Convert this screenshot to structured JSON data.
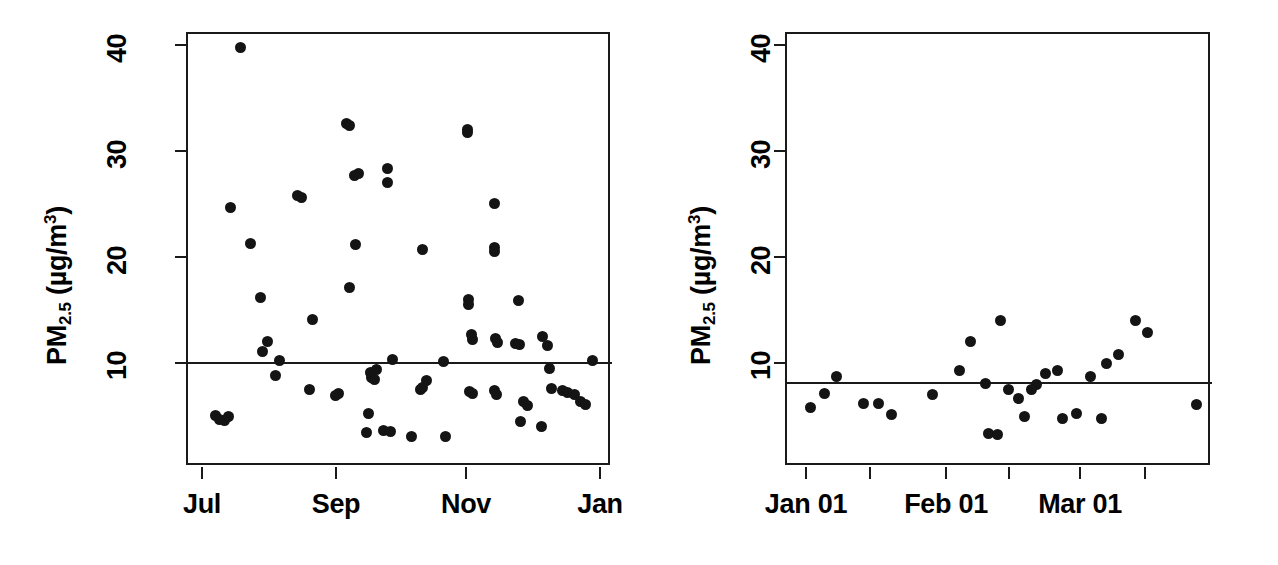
{
  "figure": {
    "background": "#ffffff",
    "point_color": "#141414",
    "axis_color": "#1a1a1a"
  },
  "chart_data": [
    {
      "type": "scatter",
      "panel": "left",
      "title": "",
      "xlabel": "",
      "ylabel": "PM2.5 (µg/m³)",
      "ylabel_parts": {
        "base": "PM",
        "sub": "2.5",
        "unit_open": " (µg/m",
        "sup": "3",
        "unit_close": ")"
      },
      "ylim": [
        1.5,
        42.5
      ],
      "yticks": [
        10,
        20,
        30,
        40
      ],
      "ytick_labels": [
        "10",
        "20",
        "30",
        "40"
      ],
      "xtick_labels": [
        "Jul",
        "Sep",
        "Nov",
        "Jan"
      ],
      "xtick_positions_px": [
        202,
        336,
        466,
        600
      ],
      "grid": false,
      "legend": "none",
      "reference_line": {
        "value": 10.3,
        "label": ""
      },
      "n_points": 68,
      "points": [
        {
          "x_px": 238,
          "y": 40.0
        },
        {
          "x_px": 228,
          "y": 24.9
        },
        {
          "x_px": 248,
          "y": 21.5
        },
        {
          "x_px": 258,
          "y": 16.4
        },
        {
          "x_px": 260,
          "y": 11.3
        },
        {
          "x_px": 265,
          "y": 12.2
        },
        {
          "x_px": 277,
          "y": 10.4
        },
        {
          "x_px": 273,
          "y": 9.0
        },
        {
          "x_px": 213,
          "y": 5.2
        },
        {
          "x_px": 217,
          "y": 4.9
        },
        {
          "x_px": 222,
          "y": 4.8
        },
        {
          "x_px": 226,
          "y": 5.1
        },
        {
          "x_px": 295,
          "y": 26.0
        },
        {
          "x_px": 299,
          "y": 25.8
        },
        {
          "x_px": 310,
          "y": 14.3
        },
        {
          "x_px": 307,
          "y": 7.7
        },
        {
          "x_px": 333,
          "y": 7.1
        },
        {
          "x_px": 336,
          "y": 7.3
        },
        {
          "x_px": 344,
          "y": 32.8
        },
        {
          "x_px": 347,
          "y": 32.6
        },
        {
          "x_px": 352,
          "y": 27.9
        },
        {
          "x_px": 356,
          "y": 28.1
        },
        {
          "x_px": 353,
          "y": 21.4
        },
        {
          "x_px": 347,
          "y": 17.3
        },
        {
          "x_px": 368,
          "y": 9.3
        },
        {
          "x_px": 369,
          "y": 8.8
        },
        {
          "x_px": 372,
          "y": 8.6
        },
        {
          "x_px": 374,
          "y": 9.6
        },
        {
          "x_px": 366,
          "y": 5.4
        },
        {
          "x_px": 364,
          "y": 3.6
        },
        {
          "x_px": 385,
          "y": 28.5
        },
        {
          "x_px": 385,
          "y": 27.2
        },
        {
          "x_px": 390,
          "y": 10.5
        },
        {
          "x_px": 381,
          "y": 3.8
        },
        {
          "x_px": 388,
          "y": 3.7
        },
        {
          "x_px": 420,
          "y": 20.9
        },
        {
          "x_px": 424,
          "y": 8.5
        },
        {
          "x_px": 420,
          "y": 7.9
        },
        {
          "x_px": 418,
          "y": 7.7
        },
        {
          "x_px": 409,
          "y": 3.3
        },
        {
          "x_px": 441,
          "y": 10.3
        },
        {
          "x_px": 443,
          "y": 3.3
        },
        {
          "x_px": 465,
          "y": 32.2
        },
        {
          "x_px": 465,
          "y": 31.9
        },
        {
          "x_px": 466,
          "y": 16.2
        },
        {
          "x_px": 466,
          "y": 15.7
        },
        {
          "x_px": 469,
          "y": 12.9
        },
        {
          "x_px": 470,
          "y": 12.4
        },
        {
          "x_px": 467,
          "y": 7.5
        },
        {
          "x_px": 470,
          "y": 7.3
        },
        {
          "x_px": 492,
          "y": 25.2
        },
        {
          "x_px": 492,
          "y": 21.1
        },
        {
          "x_px": 492,
          "y": 20.7
        },
        {
          "x_px": 493,
          "y": 12.5
        },
        {
          "x_px": 495,
          "y": 12.1
        },
        {
          "x_px": 492,
          "y": 7.6
        },
        {
          "x_px": 494,
          "y": 7.2
        },
        {
          "x_px": 516,
          "y": 16.1
        },
        {
          "x_px": 513,
          "y": 12.0
        },
        {
          "x_px": 517,
          "y": 11.9
        },
        {
          "x_px": 521,
          "y": 6.6
        },
        {
          "x_px": 525,
          "y": 6.2
        },
        {
          "x_px": 518,
          "y": 4.7
        },
        {
          "x_px": 540,
          "y": 12.7
        },
        {
          "x_px": 545,
          "y": 11.8
        },
        {
          "x_px": 547,
          "y": 9.7
        },
        {
          "x_px": 549,
          "y": 7.8
        },
        {
          "x_px": 560,
          "y": 7.6
        },
        {
          "x_px": 565,
          "y": 7.4
        },
        {
          "x_px": 572,
          "y": 7.2
        },
        {
          "x_px": 578,
          "y": 6.6
        },
        {
          "x_px": 583,
          "y": 6.3
        },
        {
          "x_px": 590,
          "y": 10.4
        },
        {
          "x_px": 539,
          "y": 4.2
        }
      ]
    },
    {
      "type": "scatter",
      "panel": "right",
      "title": "",
      "xlabel": "",
      "ylabel": "PM2.5 (µg/m³)",
      "ylabel_parts": {
        "base": "PM",
        "sub": "2.5",
        "unit_open": " (µg/m",
        "sup": "3",
        "unit_close": ")"
      },
      "ylim": [
        1.5,
        42.5
      ],
      "yticks": [
        10,
        20,
        30,
        40
      ],
      "ytick_labels": [
        "10",
        "20",
        "30",
        "40"
      ],
      "xtick_labels": [
        "Jan 01",
        "",
        "Feb 01",
        "",
        "Mar 01",
        ""
      ],
      "xtick_positions_px": [
        806,
        870,
        946,
        1009,
        1080,
        1145
      ],
      "grid": false,
      "legend": "none",
      "reference_line": {
        "value": 8.4,
        "label": ""
      },
      "n_points": 29,
      "points": [
        {
          "x_px": 808,
          "y": 6.0
        },
        {
          "x_px": 822,
          "y": 7.3
        },
        {
          "x_px": 834,
          "y": 8.9
        },
        {
          "x_px": 861,
          "y": 6.4
        },
        {
          "x_px": 876,
          "y": 6.4
        },
        {
          "x_px": 889,
          "y": 5.3
        },
        {
          "x_px": 930,
          "y": 7.2
        },
        {
          "x_px": 957,
          "y": 9.5
        },
        {
          "x_px": 968,
          "y": 12.2
        },
        {
          "x_px": 983,
          "y": 8.3
        },
        {
          "x_px": 986,
          "y": 3.5
        },
        {
          "x_px": 998,
          "y": 14.2
        },
        {
          "x_px": 1006,
          "y": 7.7
        },
        {
          "x_px": 1016,
          "y": 6.8
        },
        {
          "x_px": 1034,
          "y": 8.2
        },
        {
          "x_px": 1043,
          "y": 9.2
        },
        {
          "x_px": 1055,
          "y": 9.5
        },
        {
          "x_px": 1029,
          "y": 7.7
        },
        {
          "x_px": 1088,
          "y": 8.9
        },
        {
          "x_px": 1104,
          "y": 10.1
        },
        {
          "x_px": 1116,
          "y": 11.0
        },
        {
          "x_px": 1133,
          "y": 14.2
        },
        {
          "x_px": 1145,
          "y": 13.1
        },
        {
          "x_px": 1074,
          "y": 5.4
        },
        {
          "x_px": 1099,
          "y": 5.0
        },
        {
          "x_px": 1194,
          "y": 6.3
        },
        {
          "x_px": 1022,
          "y": 5.1
        },
        {
          "x_px": 1060,
          "y": 5.0
        },
        {
          "x_px": 995,
          "y": 3.4
        }
      ]
    }
  ]
}
